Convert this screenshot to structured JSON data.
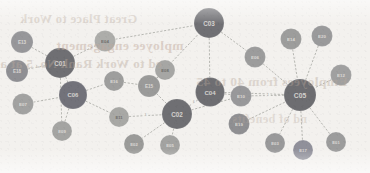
{
  "diagram": {
    "type": "network-graph",
    "title": "",
    "background_color": "#f3f1ee",
    "edge_color": "#9a9b96",
    "palette": {
      "hub_dark": "#6f6f73",
      "hub_dark_alt": "#73737a",
      "mid_gray": "#8d8d90",
      "light_gray": "#a9a9a7",
      "pale_gray": "#b9b8b4"
    },
    "bleed_text": {
      "line1": "Great Place to Work",
      "line2": "mployee engagement",
      "line3": "ed to Work Rank No. 5 at a",
      "line4": "Employees from 40 to 45",
      "line5": "nd of benefits"
    },
    "nodes": [
      {
        "id": "n01",
        "label": "E13",
        "x": 22,
        "y": 42,
        "r": 11,
        "color": "#97979a",
        "text": "light"
      },
      {
        "id": "n02",
        "label": "E18",
        "x": 17,
        "y": 71,
        "r": 11,
        "color": "#8f8f93",
        "text": "light"
      },
      {
        "id": "n03",
        "label": "E07",
        "x": 23,
        "y": 104,
        "r": 10.5,
        "color": "#a2a2a1",
        "text": "light"
      },
      {
        "id": "n04",
        "label": "C01",
        "x": 60,
        "y": 63,
        "r": 15,
        "color": "#6f6f73",
        "text": "light"
      },
      {
        "id": "n05",
        "label": "C06",
        "x": 73,
        "y": 95,
        "r": 14,
        "color": "#72727a",
        "text": "light"
      },
      {
        "id": "n06",
        "label": "E09",
        "x": 62,
        "y": 131,
        "r": 10,
        "color": "#a4a4a2",
        "text": "light"
      },
      {
        "id": "n07",
        "label": "E04",
        "x": 105,
        "y": 41,
        "r": 10.5,
        "color": "#adadaa",
        "text": "dark"
      },
      {
        "id": "n08",
        "label": "E11",
        "x": 119,
        "y": 117,
        "r": 10,
        "color": "#a8a8a5",
        "text": "dark"
      },
      {
        "id": "n09",
        "label": "E16",
        "x": 114,
        "y": 81,
        "r": 10,
        "color": "#9e9e9d",
        "text": "light"
      },
      {
        "id": "n10",
        "label": "E02",
        "x": 134,
        "y": 144,
        "r": 10,
        "color": "#9b9b99",
        "text": "light"
      },
      {
        "id": "n11",
        "label": "E05",
        "x": 170,
        "y": 145,
        "r": 10,
        "color": "#a3a3a1",
        "text": "light"
      },
      {
        "id": "n12",
        "label": "E15",
        "x": 149,
        "y": 86,
        "r": 11,
        "color": "#9a9a99",
        "text": "light"
      },
      {
        "id": "n13",
        "label": "C02",
        "x": 177,
        "y": 114,
        "r": 15,
        "color": "#6f6f73",
        "text": "light"
      },
      {
        "id": "n14",
        "label": "C03",
        "x": 209,
        "y": 23,
        "r": 15,
        "color": "#707074",
        "text": "light"
      },
      {
        "id": "n15",
        "label": "C04",
        "x": 210,
        "y": 92,
        "r": 14.5,
        "color": "#6e6e72",
        "text": "light"
      },
      {
        "id": "n16",
        "label": "E08",
        "x": 165,
        "y": 70,
        "r": 10,
        "color": "#a6a6a4",
        "text": "dark"
      },
      {
        "id": "n17",
        "label": "E10",
        "x": 241,
        "y": 96,
        "r": 10.5,
        "color": "#98989a",
        "text": "light"
      },
      {
        "id": "n18",
        "label": "E19",
        "x": 239,
        "y": 124,
        "r": 10.5,
        "color": "#8f8f92",
        "text": "light"
      },
      {
        "id": "n19",
        "label": "E06",
        "x": 255,
        "y": 57,
        "r": 10.5,
        "color": "#9c9c9c",
        "text": "light"
      },
      {
        "id": "n20",
        "label": "E14",
        "x": 291,
        "y": 39,
        "r": 10.5,
        "color": "#9d9d9c",
        "text": "light"
      },
      {
        "id": "n21",
        "label": "E20",
        "x": 322,
        "y": 36,
        "r": 10.5,
        "color": "#9a9a9b",
        "text": "light"
      },
      {
        "id": "n22",
        "label": "E12",
        "x": 341,
        "y": 75,
        "r": 10.5,
        "color": "#a0a0a0",
        "text": "light"
      },
      {
        "id": "n23",
        "label": "C05",
        "x": 300,
        "y": 95,
        "r": 16,
        "color": "#6d6d71",
        "text": "light"
      },
      {
        "id": "n24",
        "label": "E03",
        "x": 275,
        "y": 143,
        "r": 10,
        "color": "#99999a",
        "text": "light"
      },
      {
        "id": "n25",
        "label": "E17",
        "x": 303,
        "y": 150,
        "r": 10,
        "color": "#90909a",
        "text": "light"
      },
      {
        "id": "n26",
        "label": "E01",
        "x": 336,
        "y": 142,
        "r": 10,
        "color": "#9c9c9c",
        "text": "light"
      }
    ],
    "edges": [
      {
        "source": "n01",
        "target": "n04",
        "label": ""
      },
      {
        "source": "n02",
        "target": "n04",
        "label": "4"
      },
      {
        "source": "n03",
        "target": "n05",
        "label": ""
      },
      {
        "source": "n04",
        "target": "n05",
        "label": ""
      },
      {
        "source": "n04",
        "target": "n07",
        "label": ""
      },
      {
        "source": "n04",
        "target": "n06",
        "label": ""
      },
      {
        "source": "n05",
        "target": "n06",
        "label": ""
      },
      {
        "source": "n05",
        "target": "n09",
        "label": ""
      },
      {
        "source": "n05",
        "target": "n08",
        "label": ""
      },
      {
        "source": "n07",
        "target": "n14",
        "label": ""
      },
      {
        "source": "n09",
        "target": "n12",
        "label": ""
      },
      {
        "source": "n08",
        "target": "n13",
        "label": "3"
      },
      {
        "source": "n12",
        "target": "n13",
        "label": ""
      },
      {
        "source": "n12",
        "target": "n14",
        "label": ""
      },
      {
        "source": "n16",
        "target": "n12",
        "label": ""
      },
      {
        "source": "n13",
        "target": "n10",
        "label": ""
      },
      {
        "source": "n13",
        "target": "n11",
        "label": ""
      },
      {
        "source": "n13",
        "target": "n15",
        "label": "6"
      },
      {
        "source": "n13",
        "target": "n17",
        "label": "5"
      },
      {
        "source": "n14",
        "target": "n15",
        "label": ""
      },
      {
        "source": "n14",
        "target": "n19",
        "label": ""
      },
      {
        "source": "n15",
        "target": "n17",
        "label": ""
      },
      {
        "source": "n15",
        "target": "n23",
        "label": ""
      },
      {
        "source": "n17",
        "target": "n23",
        "label": "2"
      },
      {
        "source": "n18",
        "target": "n23",
        "label": ""
      },
      {
        "source": "n19",
        "target": "n23",
        "label": ""
      },
      {
        "source": "n20",
        "target": "n23",
        "label": ""
      },
      {
        "source": "n21",
        "target": "n23",
        "label": ""
      },
      {
        "source": "n22",
        "target": "n23",
        "label": ""
      },
      {
        "source": "n23",
        "target": "n24",
        "label": ""
      },
      {
        "source": "n23",
        "target": "n25",
        "label": ""
      },
      {
        "source": "n23",
        "target": "n26",
        "label": ""
      }
    ]
  }
}
